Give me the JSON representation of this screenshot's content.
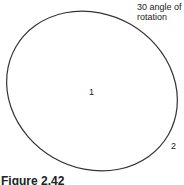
{
  "diagram": {
    "annotation": {
      "line1": "30 angle of",
      "line2": "rotation"
    },
    "label_center": "1",
    "label_edge": "2",
    "caption": "Figure 2.42",
    "stroke_color": "#333333",
    "rotation_deg": 30
  }
}
